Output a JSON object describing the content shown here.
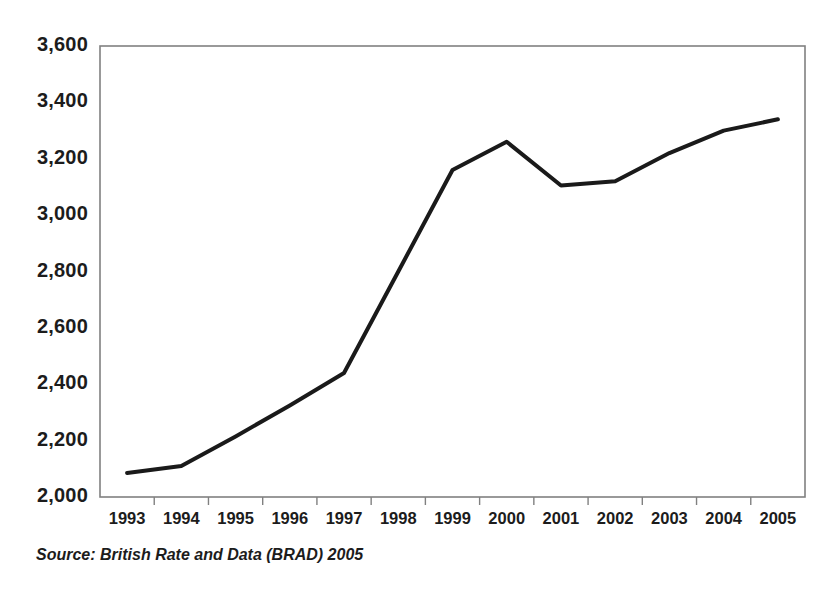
{
  "figure": {
    "source_note": "Source: British Rate and Data (BRAD) 2005"
  },
  "chart_data": {
    "type": "line",
    "title": "",
    "subtitle": "",
    "xlabel": "",
    "ylabel": "",
    "categories": [
      "1993",
      "1994",
      "1995",
      "1996",
      "1997",
      "1998",
      "1999",
      "2000",
      "2001",
      "2002",
      "2003",
      "2004",
      "2005"
    ],
    "values": [
      2085,
      2110,
      2215,
      2325,
      2440,
      2800,
      3160,
      3260,
      3105,
      3120,
      3220,
      3300,
      3340
    ],
    "series": [
      {
        "name": "",
        "values": [
          2085,
          2110,
          2215,
          2325,
          2440,
          2800,
          3160,
          3260,
          3105,
          3120,
          3220,
          3300,
          3340
        ]
      }
    ],
    "ylim": [
      2000,
      3600
    ],
    "ytick_labels": [
      "3,600",
      "3,400",
      "3,200",
      "3,000",
      "2,800",
      "2,600",
      "2,400",
      "2,200",
      "2,000"
    ],
    "ytick_values": [
      3600,
      3400,
      3200,
      3000,
      2800,
      2600,
      2400,
      2200,
      2000
    ],
    "xtick_labels": [
      "1993",
      "1994",
      "1995",
      "1996",
      "1997",
      "1998",
      "1999",
      "2000",
      "2001",
      "2002",
      "2003",
      "2004",
      "2005"
    ],
    "grid": false,
    "legend": "none",
    "line_color": "#1a1a1a",
    "line_width": 4,
    "frame_color": "#808080",
    "background_color": "#ffffff"
  }
}
